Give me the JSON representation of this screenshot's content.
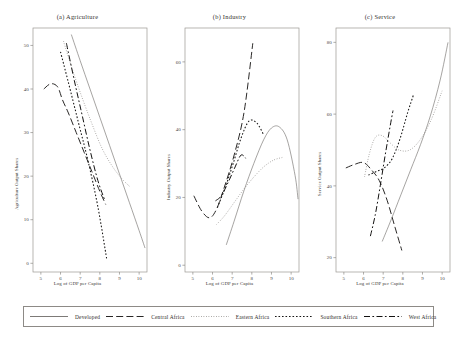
{
  "figure": {
    "axis_title_x": "Log of GDP per Capita"
  },
  "legend": {
    "items": [
      {
        "label": "Developed",
        "style": "solid"
      },
      {
        "label": "Central Africa",
        "style": "dashed"
      },
      {
        "label": "Eastern Africa",
        "style": "fine-dotted"
      },
      {
        "label": "Southern Africa",
        "style": "coarse-dotted"
      },
      {
        "label": "West Africa",
        "style": "dash-dot"
      }
    ]
  },
  "chart_data": [
    {
      "type": "line",
      "title": "(a) Agriculture",
      "xlabel": "Log of GDP per Capita",
      "ylabel": "Agriculture Output Shares",
      "xlim": [
        4.6,
        10.4
      ],
      "ylim": [
        -2,
        54
      ],
      "xticks": [
        5,
        6,
        7,
        8,
        9,
        10
      ],
      "yticks": [
        0,
        10,
        20,
        30,
        40,
        50
      ],
      "grid": false,
      "legend_position": "below-figure",
      "series": [
        {
          "name": "Developed",
          "style": "solid",
          "x": [
            6.55,
            7.0,
            7.5,
            8.0,
            8.5,
            9.0,
            9.5,
            10.0,
            10.3
          ],
          "y": [
            52.5,
            46.5,
            40.0,
            33.5,
            27.0,
            20.5,
            14.0,
            7.5,
            3.5
          ]
        },
        {
          "name": "Central Africa",
          "style": "dashed",
          "x": [
            5.15,
            5.5,
            5.85,
            6.1,
            6.4,
            6.8,
            7.2,
            7.6,
            8.0,
            8.3
          ],
          "y": [
            40.0,
            41.2,
            40.5,
            37.5,
            34.5,
            30.0,
            25.5,
            21.0,
            16.5,
            13.5
          ]
        },
        {
          "name": "Eastern Africa",
          "style": "fine-dotted",
          "x": [
            6.15,
            6.6,
            7.1,
            7.6,
            8.1,
            8.6,
            9.1,
            9.55
          ],
          "y": [
            51.0,
            44.5,
            38.0,
            32.0,
            26.5,
            22.5,
            19.5,
            17.5
          ]
        },
        {
          "name": "Southern Africa",
          "style": "coarse-dotted",
          "x": [
            6.0,
            6.4,
            6.9,
            7.4,
            7.9,
            8.35
          ],
          "y": [
            48.5,
            41.5,
            32.5,
            23.5,
            13.0,
            1.0
          ]
        },
        {
          "name": "West Africa",
          "style": "dash-dot",
          "x": [
            6.3,
            6.7,
            7.1,
            7.5,
            7.9,
            8.25
          ],
          "y": [
            50.5,
            42.0,
            34.0,
            26.0,
            19.0,
            14.5
          ]
        }
      ]
    },
    {
      "type": "line",
      "title": "(b) Industry",
      "xlabel": "Log of GDP per Capita",
      "ylabel": "Industry Output Shares",
      "xlim": [
        4.6,
        10.4
      ],
      "ylim": [
        -2,
        70
      ],
      "xticks": [
        5,
        6,
        7,
        8,
        9,
        10
      ],
      "yticks": [
        0,
        20,
        40,
        60
      ],
      "grid": false,
      "legend_position": "below-figure",
      "series": [
        {
          "name": "Developed",
          "style": "solid",
          "x": [
            6.7,
            7.1,
            7.6,
            8.1,
            8.6,
            9.0,
            9.4,
            9.8,
            10.2,
            10.35
          ],
          "y": [
            6.0,
            13.0,
            22.0,
            30.0,
            37.0,
            40.5,
            40.8,
            37.0,
            26.5,
            19.5
          ]
        },
        {
          "name": "Central Africa",
          "style": "dashed",
          "x": [
            5.05,
            5.45,
            5.85,
            6.2,
            6.6,
            7.1,
            7.6,
            8.05
          ],
          "y": [
            20.5,
            16.0,
            14.0,
            16.5,
            23.0,
            32.5,
            45.0,
            65.5
          ]
        },
        {
          "name": "Eastern Africa",
          "style": "fine-dotted",
          "x": [
            6.2,
            6.6,
            7.1,
            7.6,
            8.1,
            8.6,
            9.1,
            9.55
          ],
          "y": [
            12.0,
            14.5,
            18.5,
            22.5,
            26.0,
            29.0,
            31.0,
            31.8
          ]
        },
        {
          "name": "Southern Africa",
          "style": "coarse-dotted",
          "x": [
            6.25,
            6.65,
            7.05,
            7.45,
            7.85,
            8.25,
            8.6
          ],
          "y": [
            17.0,
            23.0,
            30.0,
            37.5,
            42.5,
            42.0,
            38.5
          ]
        },
        {
          "name": "West Africa",
          "style": "dash-dot",
          "x": [
            6.15,
            6.45,
            6.8,
            7.15,
            7.45,
            7.7
          ],
          "y": [
            19.0,
            20.5,
            24.5,
            29.0,
            32.5,
            31.5
          ]
        }
      ]
    },
    {
      "type": "line",
      "title": "(c) Service",
      "xlabel": "Log of GDP per Capita",
      "ylabel": "Service Output Shares",
      "xlim": [
        4.6,
        10.4
      ],
      "ylim": [
        16,
        84
      ],
      "xticks": [
        5,
        6,
        7,
        8,
        9,
        10
      ],
      "yticks": [
        20,
        40,
        60,
        80
      ],
      "grid": false,
      "legend_position": "below-figure",
      "series": [
        {
          "name": "Developed",
          "style": "solid",
          "x": [
            6.95,
            7.4,
            7.9,
            8.4,
            8.9,
            9.4,
            9.9,
            10.3
          ],
          "y": [
            24.5,
            30.5,
            37.5,
            44.5,
            51.5,
            59.5,
            69.5,
            80.0
          ]
        },
        {
          "name": "Central Africa",
          "style": "dashed",
          "x": [
            5.1,
            5.55,
            6.0,
            6.4,
            6.8,
            7.2,
            7.6,
            7.95
          ],
          "y": [
            45.0,
            46.0,
            46.5,
            44.5,
            41.5,
            36.0,
            28.5,
            22.0
          ]
        },
        {
          "name": "Eastern Africa",
          "style": "fine-dotted",
          "x": [
            6.05,
            6.3,
            6.6,
            6.95,
            7.35,
            7.8,
            8.35,
            8.9,
            9.45,
            10.0
          ],
          "y": [
            42.5,
            49.0,
            53.5,
            54.0,
            52.0,
            50.0,
            50.0,
            53.0,
            58.5,
            66.5
          ]
        },
        {
          "name": "Southern Africa",
          "style": "coarse-dotted",
          "x": [
            6.25,
            6.65,
            7.05,
            7.45,
            7.85,
            8.25,
            8.55
          ],
          "y": [
            43.0,
            44.0,
            45.0,
            47.5,
            53.0,
            60.5,
            65.5
          ]
        },
        {
          "name": "West Africa",
          "style": "dash-dot",
          "x": [
            6.35,
            6.6,
            6.85,
            7.1,
            7.35,
            7.5
          ],
          "y": [
            26.0,
            32.0,
            40.0,
            48.5,
            56.5,
            61.0
          ]
        }
      ]
    }
  ]
}
